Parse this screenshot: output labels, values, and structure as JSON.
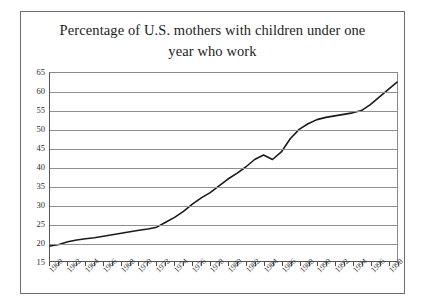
{
  "chart_data": {
    "type": "line",
    "title": "Percentage of U.S. mothers with children under one year who work",
    "title_line1": "Percentage of U.S. mothers with children under one",
    "title_line2": "year who work",
    "xlabel": "",
    "ylabel": "",
    "xlim": [
      1960,
      1999
    ],
    "ylim": [
      15,
      65
    ],
    "ytick_step": 5,
    "grid": true,
    "legend": false,
    "line_color": "#1a1a1a",
    "axis_color": "#555555",
    "grid_color": "#8f8f8f",
    "background": "#ffffff",
    "yticks": [
      15,
      20,
      25,
      30,
      35,
      40,
      45,
      50,
      55,
      60,
      65
    ],
    "xticks": [
      1960,
      1962,
      1964,
      1966,
      1968,
      1970,
      1972,
      1974,
      1976,
      1978,
      1980,
      1982,
      1984,
      1986,
      1988,
      1990,
      1992,
      1994,
      1996,
      1998
    ],
    "x": [
      1960,
      1961,
      1962,
      1963,
      1964,
      1965,
      1966,
      1967,
      1968,
      1969,
      1970,
      1971,
      1972,
      1973,
      1974,
      1975,
      1976,
      1977,
      1978,
      1979,
      1980,
      1981,
      1982,
      1983,
      1984,
      1985,
      1986,
      1987,
      1988,
      1989,
      1990,
      1991,
      1992,
      1993,
      1994,
      1995,
      1996,
      1997,
      1998,
      1999
    ],
    "values": [
      19.0,
      19.4,
      20.1,
      20.6,
      20.9,
      21.2,
      21.6,
      22.0,
      22.4,
      22.8,
      23.2,
      23.5,
      24.0,
      25.3,
      26.6,
      28.2,
      30.1,
      31.8,
      33.2,
      35.0,
      36.8,
      38.3,
      40.0,
      42.0,
      43.2,
      42.0,
      44.0,
      47.5,
      50.0,
      51.5,
      52.6,
      53.2,
      53.6,
      54.0,
      54.4,
      55.0,
      56.6,
      58.6,
      60.6,
      62.6
    ],
    "features": [
      {
        "label": "start",
        "year": 1960,
        "value": 19.0
      },
      {
        "label": "local-peak",
        "year": 1984,
        "value": 43.2
      },
      {
        "label": "local-dip",
        "year": 1985,
        "value": 42.0
      },
      {
        "label": "plateau",
        "year_range": [
          1990,
          1995
        ],
        "value_range": [
          52.6,
          55.0
        ]
      },
      {
        "label": "end",
        "year": 1999,
        "value": 62.6
      }
    ]
  }
}
